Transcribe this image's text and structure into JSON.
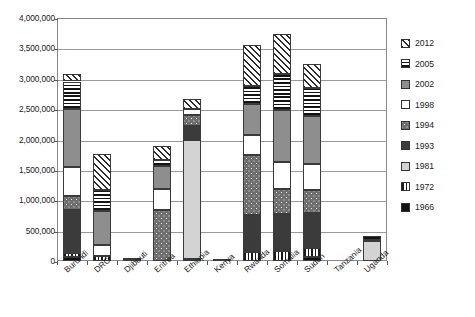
{
  "chart_data": {
    "type": "bar",
    "title": "",
    "subtitle": "",
    "xlabel": "",
    "ylabel": "",
    "stacked": true,
    "grid": true,
    "legend_position": "right",
    "ylim": [
      0,
      4000000
    ],
    "ytick_values": [
      0,
      500000,
      1000000,
      1500000,
      2000000,
      2500000,
      3000000,
      3500000,
      4000000
    ],
    "ytick_labels": [
      "0",
      "500,000",
      "1,000,000",
      "1,500,000",
      "2,000,000",
      "2,500,000",
      "3,000,000",
      "3,500,000",
      "4,000,000"
    ],
    "categories": [
      "Burundi",
      "DRC",
      "Djibouti",
      "Eritrea",
      "Ethiopia",
      "Kenya",
      "Rwanda",
      "Somalia",
      "Sudan",
      "Tanzania",
      "Uganda"
    ],
    "series": [
      {
        "name": "1966",
        "pattern": "solid-black",
        "values": [
          60000,
          0,
          0,
          0,
          0,
          0,
          0,
          0,
          70000,
          0,
          0
        ]
      },
      {
        "name": "1972",
        "pattern": "vertical-stripes",
        "values": [
          75000,
          80000,
          0,
          0,
          40000,
          30000,
          150000,
          170000,
          140000,
          0,
          0
        ]
      },
      {
        "name": "1981",
        "pattern": "light-gray",
        "values": [
          0,
          0,
          20000,
          0,
          1950000,
          0,
          0,
          0,
          0,
          0,
          330000
        ]
      },
      {
        "name": "1993",
        "pattern": "dark-gray",
        "values": [
          700000,
          0,
          0,
          0,
          230000,
          0,
          600000,
          600000,
          580000,
          0,
          0
        ]
      },
      {
        "name": "1994",
        "pattern": "dotted",
        "values": [
          230000,
          0,
          35000,
          840000,
          180000,
          0,
          1000000,
          420000,
          380000,
          0,
          0
        ]
      },
      {
        "name": "1998",
        "pattern": "white",
        "values": [
          480000,
          180000,
          0,
          350000,
          100000,
          0,
          320000,
          440000,
          420000,
          0,
          0
        ]
      },
      {
        "name": "2002",
        "pattern": "mid-gray",
        "values": [
          960000,
          560000,
          0,
          380000,
          0,
          0,
          520000,
          850000,
          800000,
          0,
          15000
        ]
      },
      {
        "name": "2005",
        "pattern": "horizontal-stripes",
        "values": [
          450000,
          350000,
          0,
          100000,
          0,
          0,
          290000,
          600000,
          460000,
          0,
          75000
        ]
      },
      {
        "name": "2012",
        "pattern": "diagonal-hatch",
        "values": [
          130000,
          590000,
          0,
          230000,
          170000,
          0,
          670000,
          650000,
          400000,
          0,
          0
        ]
      }
    ],
    "totals": [
      3085000,
      1760000,
      55000,
      1900000,
      2670000,
      30000,
      3550000,
      3730000,
      3250000,
      10000,
      420000
    ]
  },
  "legend": {
    "items": [
      {
        "label": "2012",
        "pattern": "diagonal-hatch"
      },
      {
        "label": "2005",
        "pattern": "horizontal-stripes"
      },
      {
        "label": "2002",
        "pattern": "mid-gray"
      },
      {
        "label": "1998",
        "pattern": "white"
      },
      {
        "label": "1994",
        "pattern": "dotted"
      },
      {
        "label": "1993",
        "pattern": "dark-gray"
      },
      {
        "label": "1981",
        "pattern": "light-gray"
      },
      {
        "label": "1972",
        "pattern": "vertical-stripes"
      },
      {
        "label": "1966",
        "pattern": "solid-black"
      }
    ]
  },
  "colors": {
    "axis": "#8a8a8a",
    "grid": "#9a9a9a",
    "text": "#1a1a1a",
    "background": "#ffffff"
  }
}
